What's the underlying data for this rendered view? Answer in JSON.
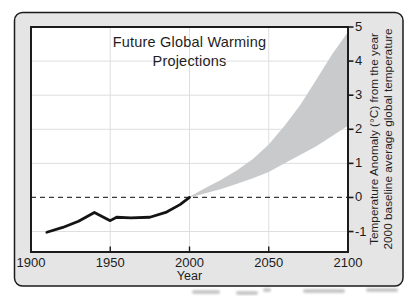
{
  "chart_data": {
    "type": "line",
    "title_line1": "Future Global Warming",
    "title_line2": "Projections",
    "xlabel": "Year",
    "ylabel_line1": "Temperature Anomaly (°C) from the year",
    "ylabel_line2": "2000 baseline average global temperature",
    "xlim": [
      1900,
      2100
    ],
    "ylim": [
      -1.6,
      5
    ],
    "x_ticks": [
      1900,
      1950,
      2000,
      2050,
      2100
    ],
    "y_ticks": [
      5,
      4,
      3,
      2,
      1,
      0,
      -1
    ],
    "grid": {
      "h_values": [
        4,
        3,
        2,
        1,
        -1
      ],
      "v_values": [
        1950,
        2000,
        2050
      ]
    },
    "baseline": {
      "y": 0,
      "style": "dashed"
    },
    "series": [
      {
        "name": "observed temperature anomaly",
        "type": "line",
        "color": "#141414",
        "points": [
          [
            1910,
            -1.02
          ],
          [
            1920,
            -0.88
          ],
          [
            1930,
            -0.7
          ],
          [
            1940,
            -0.44
          ],
          [
            1950,
            -0.68
          ],
          [
            1954,
            -0.58
          ],
          [
            1963,
            -0.6
          ],
          [
            1975,
            -0.58
          ],
          [
            1985,
            -0.44
          ],
          [
            1994,
            -0.21
          ],
          [
            2000,
            0.0
          ]
        ]
      },
      {
        "name": "projected warming range",
        "type": "band",
        "color": "#c9cacc",
        "upper": [
          [
            2000,
            0.02
          ],
          [
            2010,
            0.28
          ],
          [
            2020,
            0.52
          ],
          [
            2030,
            0.8
          ],
          [
            2040,
            1.13
          ],
          [
            2050,
            1.55
          ],
          [
            2060,
            2.1
          ],
          [
            2070,
            2.72
          ],
          [
            2080,
            3.45
          ],
          [
            2090,
            4.2
          ],
          [
            2100,
            4.85
          ]
        ],
        "lower": [
          [
            2000,
            0.0
          ],
          [
            2010,
            0.12
          ],
          [
            2020,
            0.25
          ],
          [
            2030,
            0.4
          ],
          [
            2040,
            0.56
          ],
          [
            2050,
            0.75
          ],
          [
            2060,
            1.0
          ],
          [
            2070,
            1.25
          ],
          [
            2080,
            1.5
          ],
          [
            2090,
            1.8
          ],
          [
            2100,
            2.1
          ]
        ]
      }
    ],
    "colors": {
      "frame_bg": "#e5e5e6",
      "plot_bg": "#ffffff",
      "grid": "#dededf",
      "band": "#c9cacc",
      "line": "#141414",
      "border": "#1b1b1b",
      "dashed": "#3a3a3a",
      "text": "#1e1e1e"
    }
  }
}
